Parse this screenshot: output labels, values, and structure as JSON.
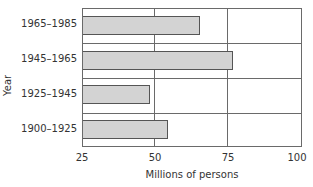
{
  "chart_data": {
    "type": "bar",
    "orientation": "horizontal",
    "title": "",
    "categories": [
      "1965–1985",
      "1945–1965",
      "1925–1945",
      "1900–1925"
    ],
    "values": [
      65,
      76,
      48,
      54
    ],
    "xlabel": "Millions of persons",
    "ylabel": "Year",
    "xlim": [
      25,
      100
    ],
    "xticks": [
      "25",
      "50",
      "75",
      "100"
    ],
    "grid": true,
    "bar_color": "#d3d3d3",
    "bar_edge_color": "#555555"
  }
}
